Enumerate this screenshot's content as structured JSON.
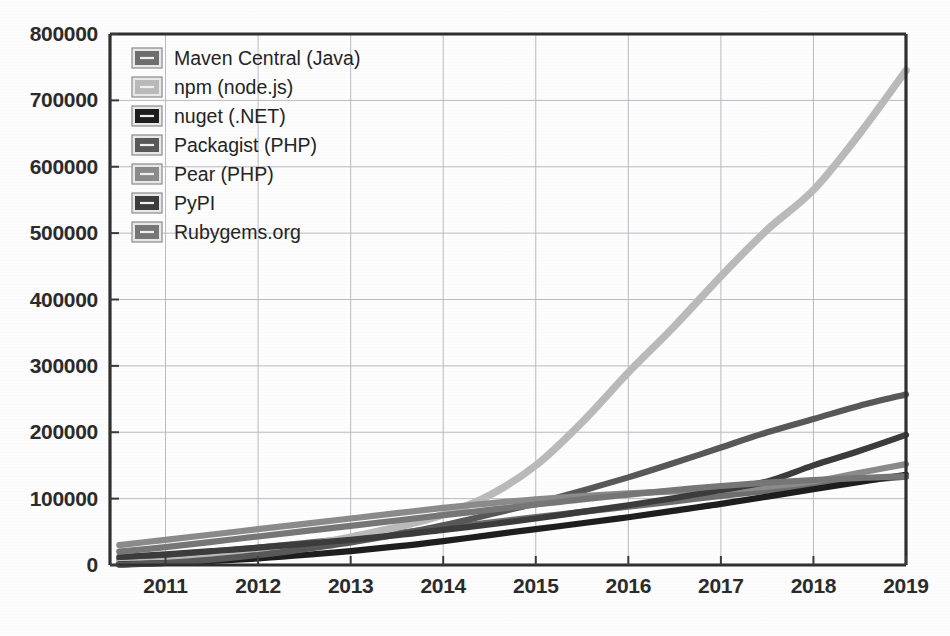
{
  "chart_data": {
    "type": "line",
    "title": "",
    "xlabel": "",
    "ylabel": "",
    "xlim": [
      2010.4,
      2019.0
    ],
    "ylim": [
      0,
      800000
    ],
    "grid": true,
    "legend_position": "top-left inside plot",
    "x_ticks": [
      "2011",
      "2012",
      "2013",
      "2014",
      "2015",
      "2016",
      "2017",
      "2018",
      "2019"
    ],
    "x_tick_values": [
      2011,
      2012,
      2013,
      2014,
      2015,
      2016,
      2017,
      2018,
      2019
    ],
    "y_ticks": [
      "0",
      "100000",
      "200000",
      "300000",
      "400000",
      "500000",
      "600000",
      "700000",
      "800000"
    ],
    "y_tick_values": [
      0,
      100000,
      200000,
      300000,
      400000,
      500000,
      600000,
      700000,
      800000
    ],
    "x": [
      2010.5,
      2011,
      2011.5,
      2012,
      2012.5,
      2013,
      2013.5,
      2014,
      2014.5,
      2015,
      2015.5,
      2016,
      2016.5,
      2017,
      2017.5,
      2018,
      2018.5,
      2019
    ],
    "series": [
      {
        "name": "Maven Central (Java)",
        "color": "#6e6e6e",
        "values": [
          9000,
          14000,
          20000,
          26000,
          33000,
          40000,
          48000,
          56000,
          64000,
          72000,
          80000,
          88000,
          96000,
          104000,
          112000,
          120000,
          127000,
          133000
        ]
      },
      {
        "name": "npm (node.js)",
        "color": "#b9b9b9",
        "values": [
          2000,
          5000,
          11000,
          19000,
          29000,
          42000,
          57000,
          76000,
          105000,
          150000,
          215000,
          290000,
          360000,
          435000,
          505000,
          565000,
          650000,
          745000
        ]
      },
      {
        "name": "nuget (.NET)",
        "color": "#1e1e1e",
        "values": [
          1000,
          3000,
          6000,
          10000,
          15000,
          21000,
          28000,
          36000,
          45000,
          54000,
          63000,
          72000,
          82000,
          92000,
          103000,
          114000,
          125000,
          136000
        ]
      },
      {
        "name": "Packagist (PHP)",
        "color": "#585858",
        "values": [
          500,
          3000,
          8000,
          15000,
          24000,
          34000,
          46000,
          60000,
          76000,
          93000,
          112000,
          132000,
          154000,
          177000,
          200000,
          220000,
          240000,
          257000
        ]
      },
      {
        "name": "Pear (PHP)",
        "color": "#8a8a8a",
        "values": [
          30000,
          38000,
          46000,
          54000,
          62000,
          70000,
          78000,
          86000,
          93000,
          99000,
          104000,
          108000,
          111000,
          113000,
          118000,
          126000,
          139000,
          152000
        ]
      },
      {
        "name": "PyPI",
        "color": "#3c3c3c",
        "values": [
          12000,
          16000,
          21000,
          26000,
          32000,
          38000,
          45000,
          53000,
          61000,
          70000,
          80000,
          90000,
          101000,
          113000,
          126000,
          150000,
          172000,
          196000
        ]
      },
      {
        "name": "Rubygems.org",
        "color": "#767676",
        "values": [
          20000,
          27000,
          35000,
          43000,
          51000,
          59000,
          67000,
          75000,
          83000,
          91000,
          99000,
          106000,
          113000,
          119000,
          124000,
          128000,
          131000,
          134000
        ]
      }
    ],
    "legend_entries": [
      {
        "label": "Maven Central (Java)",
        "color": "#6e6e6e"
      },
      {
        "label": "npm (node.js)",
        "color": "#b9b9b9"
      },
      {
        "label": "nuget (.NET)",
        "color": "#1e1e1e"
      },
      {
        "label": "Packagist (PHP)",
        "color": "#585858"
      },
      {
        "label": "Pear (PHP)",
        "color": "#8a8a8a"
      },
      {
        "label": "PyPI",
        "color": "#3c3c3c"
      },
      {
        "label": "Rubygems.org",
        "color": "#767676"
      }
    ]
  },
  "colors": {
    "axis": "#2f2f2f",
    "grid": "#b9b9c2",
    "text": "#2b2b2b",
    "background": "#fdfdfd"
  }
}
